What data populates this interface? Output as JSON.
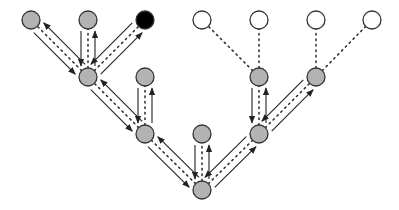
{
  "diagram": {
    "type": "tree-traversal",
    "colors": {
      "visited": "#b3b3b3",
      "current": "#000000",
      "unvisited": "#ffffff",
      "stroke": "#333333"
    },
    "nodes": [
      {
        "id": "a1",
        "x": 31,
        "y": 20,
        "state": "visited"
      },
      {
        "id": "a2",
        "x": 88,
        "y": 20,
        "state": "visited"
      },
      {
        "id": "a3",
        "x": 145,
        "y": 20,
        "state": "current"
      },
      {
        "id": "a4",
        "x": 202,
        "y": 20,
        "state": "unvisited"
      },
      {
        "id": "a5",
        "x": 259,
        "y": 20,
        "state": "unvisited"
      },
      {
        "id": "a6",
        "x": 316,
        "y": 20,
        "state": "unvisited"
      },
      {
        "id": "a7",
        "x": 372,
        "y": 20,
        "state": "unvisited"
      },
      {
        "id": "b1",
        "x": 88,
        "y": 77,
        "state": "visited"
      },
      {
        "id": "b2",
        "x": 145,
        "y": 77,
        "state": "visited"
      },
      {
        "id": "b3",
        "x": 259,
        "y": 77,
        "state": "visited"
      },
      {
        "id": "b4",
        "x": 316,
        "y": 77,
        "state": "visited"
      },
      {
        "id": "c1",
        "x": 145,
        "y": 134,
        "state": "visited"
      },
      {
        "id": "c2",
        "x": 202,
        "y": 134,
        "state": "visited"
      },
      {
        "id": "c3",
        "x": 259,
        "y": 134,
        "state": "visited"
      },
      {
        "id": "d1",
        "x": 202,
        "y": 190,
        "state": "visited"
      }
    ],
    "edges": [
      {
        "from": "d1",
        "to": "c1",
        "traversed": true
      },
      {
        "from": "d1",
        "to": "c2",
        "traversed": true
      },
      {
        "from": "d1",
        "to": "c3",
        "traversed": true
      },
      {
        "from": "c1",
        "to": "b1",
        "traversed": true
      },
      {
        "from": "c1",
        "to": "b2",
        "traversed": true
      },
      {
        "from": "b1",
        "to": "a1",
        "traversed": true
      },
      {
        "from": "b1",
        "to": "a2",
        "traversed": true
      },
      {
        "from": "b1",
        "to": "a3",
        "traversed": true
      },
      {
        "from": "c3",
        "to": "b3",
        "traversed": true
      },
      {
        "from": "c3",
        "to": "b4",
        "traversed": true
      },
      {
        "from": "b3",
        "to": "a4",
        "traversed": false
      },
      {
        "from": "b3",
        "to": "a5",
        "traversed": false
      },
      {
        "from": "b4",
        "to": "a6",
        "traversed": false
      },
      {
        "from": "b4",
        "to": "a7",
        "traversed": false
      }
    ]
  }
}
